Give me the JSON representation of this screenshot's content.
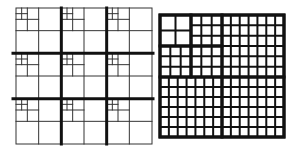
{
  "figure": {
    "left_grid": {
      "description": "Uniform 3x3 coarse grid with quadtree refinement toward top-left of each coarse cell",
      "x": 16,
      "y": 8,
      "size": 136,
      "coarse_divisions": 3,
      "refinement_levels": 3,
      "thick_line_color": "#111111",
      "thin_line_color": "#333333"
    },
    "right_grid": {
      "description": "Block-structured grid with thick block borders and thin cell lines",
      "x": 160,
      "y": 15,
      "width": 124,
      "height": 122,
      "split_x": 222,
      "split_y": 77,
      "blocks": [
        {
          "name": "top-left-a",
          "x0": 160,
          "y0": 15,
          "x1": 191,
          "y1": 46,
          "cols": 2,
          "rows": 2
        },
        {
          "name": "top-left-b",
          "x0": 191,
          "y0": 15,
          "x1": 222,
          "y1": 46,
          "cols": 3,
          "rows": 3
        },
        {
          "name": "top-left-c",
          "x0": 160,
          "y0": 46,
          "x1": 191,
          "y1": 77,
          "cols": 3,
          "rows": 3
        },
        {
          "name": "top-left-d",
          "x0": 191,
          "y0": 46,
          "x1": 222,
          "y1": 77,
          "cols": 3,
          "rows": 3
        },
        {
          "name": "top-right",
          "x0": 222,
          "y0": 15,
          "x1": 284,
          "y1": 77,
          "cols": 7,
          "rows": 6
        },
        {
          "name": "bottom-left",
          "x0": 160,
          "y0": 77,
          "x1": 222,
          "y1": 137,
          "cols": 7,
          "rows": 6
        },
        {
          "name": "bottom-right",
          "x0": 222,
          "y0": 77,
          "x1": 284,
          "y1": 137,
          "cols": 7,
          "rows": 6
        }
      ],
      "line_color": "#111111"
    }
  }
}
